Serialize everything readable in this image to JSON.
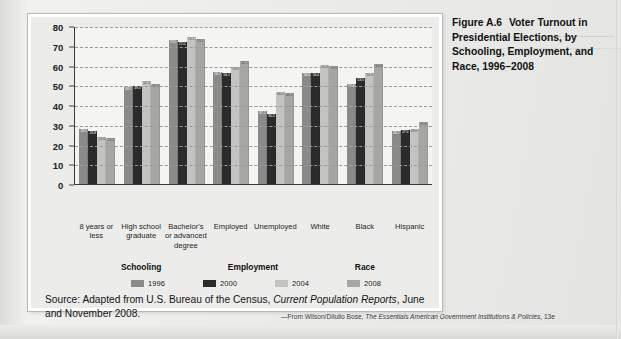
{
  "caption": {
    "number": "Figure A.6",
    "text": "Voter Turnout in Presidential Elections, by Schooling, Employment, and Race, 1996–2008"
  },
  "source": {
    "prefix": "Source: Adapted from U.S. Bureau of the Census, ",
    "italic": "Current Population Reports",
    "suffix": ", June and November 2008."
  },
  "attribution": {
    "prefix": "—From Wilson/DiIulio Bose, ",
    "italic": "The Essentials American Government Institutions & Policies",
    "suffix": ", 13e"
  },
  "group_labels": [
    "Schooling",
    "Employment",
    "Race"
  ],
  "colors": {
    "1996": "#8a8a88",
    "2000": "#2b2b2b",
    "2004": "#c3c3c1",
    "2008": "#a6a6a4",
    "panel_bg": "#ececea",
    "plot_bg": "#f4f4f2",
    "axis": "#3a3a3a",
    "grid": "#9a9a98"
  },
  "chart_data": {
    "type": "bar",
    "title": "Voter Turnout in Presidential Elections, by Schooling, Employment, and Race, 1996–2008",
    "xlabel": "",
    "ylabel": "",
    "ylim": [
      0,
      80
    ],
    "yticks": [
      0,
      10,
      20,
      30,
      40,
      50,
      60,
      70,
      80
    ],
    "grid": true,
    "legend_position": "bottom",
    "categories": [
      "8 years or less",
      "High school graduate",
      "Bachelor's or advanced degree",
      "Employed",
      "Unemployed",
      "White",
      "Black",
      "Hispanic"
    ],
    "series": [
      {
        "name": "1996",
        "values": [
          28.1,
          49.1,
          73.0,
          56.7,
          37.2,
          56.0,
          50.6,
          26.7
        ]
      },
      {
        "name": "2000",
        "values": [
          26.8,
          49.4,
          72.0,
          56.1,
          35.5,
          56.4,
          53.5,
          27.5
        ]
      },
      {
        "name": "2004",
        "values": [
          23.6,
          52.4,
          74.2,
          59.2,
          46.4,
          60.3,
          56.3,
          28.0
        ]
      },
      {
        "name": "2008",
        "values": [
          23.2,
          50.5,
          73.5,
          62.1,
          46.2,
          59.6,
          60.8,
          31.6
        ]
      }
    ]
  }
}
